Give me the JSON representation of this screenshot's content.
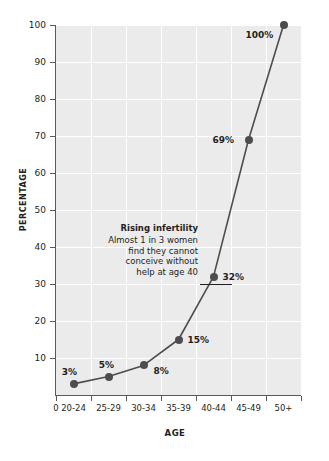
{
  "chart_data": {
    "type": "line",
    "title": "",
    "xlabel": "AGE",
    "ylabel": "PERCENTAGE",
    "categories": [
      "20-24",
      "25-29",
      "30-34",
      "35-39",
      "40-44",
      "45-49",
      "50+"
    ],
    "values": [
      3,
      5,
      8,
      15,
      32,
      69,
      100
    ],
    "point_labels": [
      "3%",
      "5%",
      "8%",
      "15%",
      "32%",
      "69%",
      "100%"
    ],
    "ylim": [
      0,
      100
    ],
    "yticks": [
      10,
      20,
      30,
      40,
      50,
      60,
      70,
      80,
      90,
      100
    ],
    "ytick_labels": [
      "10",
      "20",
      "30",
      "40",
      "50",
      "60",
      "70",
      "80",
      "90",
      "100"
    ],
    "xtick_labels": [
      "0",
      "20-24",
      "25-29",
      "30-34",
      "35-39",
      "40-44",
      "45-49",
      "50+"
    ],
    "grid": true,
    "legend": "none",
    "series_color": "#4d4d4f",
    "plot_background": "#ebebeb",
    "gridline_color": "#ffffff",
    "annotations": [
      {
        "title": "Rising infertility",
        "lines": [
          "Almost 1 in 3 women",
          "find they cannot",
          "conceive without",
          "help at age 40"
        ],
        "points_to": "32%"
      }
    ]
  },
  "axis": {
    "y_title": "PERCENTAGE",
    "x_title": "AGE"
  },
  "annotation": {
    "title": "Rising infertility",
    "line1": "Almost 1 in 3 women",
    "line2": "find they cannot",
    "line3": "conceive without",
    "line4": "help at age 40"
  }
}
